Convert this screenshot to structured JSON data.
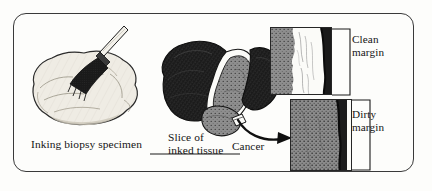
{
  "figure": {
    "kind": "medical-illustration",
    "frame": {
      "shape": "rounded-rectangle",
      "border_color": "#3a3a3a",
      "background": "#fdfdfb"
    },
    "colors": {
      "ink": "#1d1d1d",
      "specimen_pale": "#efece4",
      "tissue_gray": "#8e8e8e",
      "tissue_gray_dark": "#7b7b7b",
      "margin_white": "#fbfbf8",
      "line": "#262626",
      "text": "#141414"
    }
  },
  "labels": {
    "inking": "Inking biopsy specimen",
    "slice": "Slice of\ninked tissue",
    "clean_margin": "Clean\nmargin",
    "dirty_margin": "Dirty\nmargin",
    "cancer": "Cancer"
  },
  "panels": [
    {
      "id": "clean-margin",
      "label": "Clean margin",
      "description": "Microscopic view: gray tumor tissue at left, clear white uninvolved tissue band, dark inked surgical edge at right",
      "has_clear_zone": true
    },
    {
      "id": "dirty-margin",
      "label": "Dirty margin",
      "description": "Microscopic view: gray tumor tissue extends all the way to the dark inked surgical edge",
      "has_clear_zone": false
    }
  ],
  "scenes": [
    {
      "id": "inking",
      "label": "Inking biopsy specimen",
      "description": "A brush applies ink to a pale lobulated biopsy specimen"
    },
    {
      "id": "slice",
      "label": "Slice of inked tissue",
      "description": "Dark inked specimen cut open revealing speckled gray interior"
    }
  ],
  "connectors": [
    {
      "id": "arrow-to-cancer",
      "type": "curved-arrow",
      "from": "slice",
      "to": "dirty-margin"
    },
    {
      "id": "bracket-clean",
      "type": "bracket",
      "target": "clean-margin"
    },
    {
      "id": "bracket-dirty",
      "type": "bracket",
      "target": "dirty-margin"
    },
    {
      "id": "leader-cancer",
      "type": "leader-line",
      "target": "cancer"
    }
  ]
}
